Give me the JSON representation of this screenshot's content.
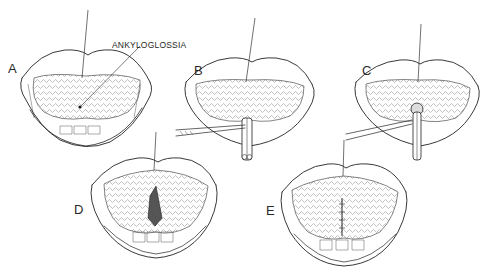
{
  "figure": {
    "callout_label": "ANKYLOGLOSSIA",
    "ink_color": "#222222",
    "background_color": "#ffffff",
    "panels": [
      {
        "label": "A",
        "description": "Open mouth, tongue elevated by traction suture, short lingual frenulum marked by callout"
      },
      {
        "label": "B",
        "description": "Hemostat clamping frenulum while tongue elevated by suture"
      },
      {
        "label": "C",
        "description": "Scissors dividing the crushed frenulum between clamp"
      },
      {
        "label": "D",
        "description": "Tongue freed, diamond-shaped wound on undersurface"
      },
      {
        "label": "E",
        "description": "Wound closed longitudinally with sutures"
      }
    ]
  }
}
